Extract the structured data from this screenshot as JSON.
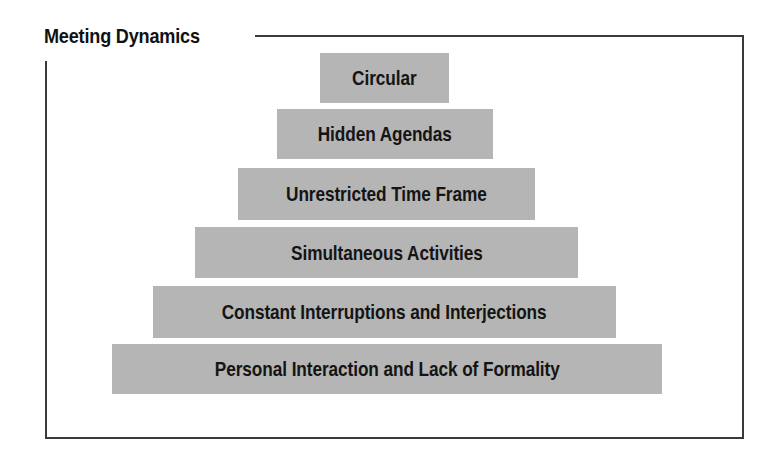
{
  "diagram": {
    "title": "Meeting Dynamics",
    "type": "pyramid",
    "tiers": [
      {
        "label": "Circular",
        "level": 1
      },
      {
        "label": "Hidden Agendas",
        "level": 2
      },
      {
        "label": "Unrestricted Time Frame",
        "level": 3
      },
      {
        "label": "Simultaneous Activities",
        "level": 4
      },
      {
        "label": "Constant Interruptions and Interjections",
        "level": 5
      },
      {
        "label": "Personal Interaction and Lack of Formality",
        "level": 6
      }
    ],
    "colors": {
      "tier_fill": "#b5b5b5",
      "text": "#141414",
      "frame": "#3a3a3a",
      "background": "#ffffff"
    }
  }
}
